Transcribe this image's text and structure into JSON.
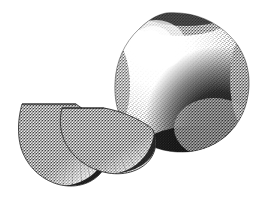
{
  "canvas": {
    "width": 263,
    "height": 205,
    "background_color": "#ffffff",
    "ink_color": "#111111",
    "style": "stipple-engraving",
    "title": "Whole round fruit with two cut wedges"
  },
  "artwork": {
    "subject": "fruit-still-life",
    "technique": "stipple dot shading with fine radiating hatch lines",
    "medium": "pen-and-ink engraving",
    "palette": {
      "paper": "#ffffff",
      "ink": "#111111",
      "mid_tone": "#6f6f6f",
      "light_tone": "#c9c9c9",
      "shadow_tone": "#1a1a1a"
    }
  },
  "objects": [
    {
      "id": "whole-fruit",
      "label": "whole round fruit",
      "shape": "sphere",
      "center": [
        182,
        82
      ],
      "radius_x": 67,
      "radius_y": 70,
      "bounds": [
        115,
        13,
        249,
        152
      ],
      "highlight_center": [
        155,
        45
      ],
      "highlight_radius": 40,
      "shadow_anchor": [
        226,
        128
      ],
      "stipple_density": "graded light-top-left to dark-bottom-right"
    },
    {
      "id": "back-wedge",
      "label": "back cut wedge slice",
      "shape": "half-disc-fan",
      "apex": [
        76,
        104
      ],
      "bounds": [
        18,
        102,
        106,
        186
      ],
      "radius": 82,
      "ray_count": 34,
      "rind_side": "bottom-right",
      "flat_edge": "top"
    },
    {
      "id": "front-wedge",
      "label": "front cut wedge slice",
      "shape": "half-disc-fan",
      "apex": [
        104,
        108
      ],
      "bounds": [
        60,
        107,
        156,
        174
      ],
      "radius": 68,
      "ray_count": 34,
      "rind_side": "bottom-right",
      "flat_edge": "top"
    }
  ],
  "annotations": {
    "caption": "",
    "figure_number": "",
    "credit": ""
  }
}
